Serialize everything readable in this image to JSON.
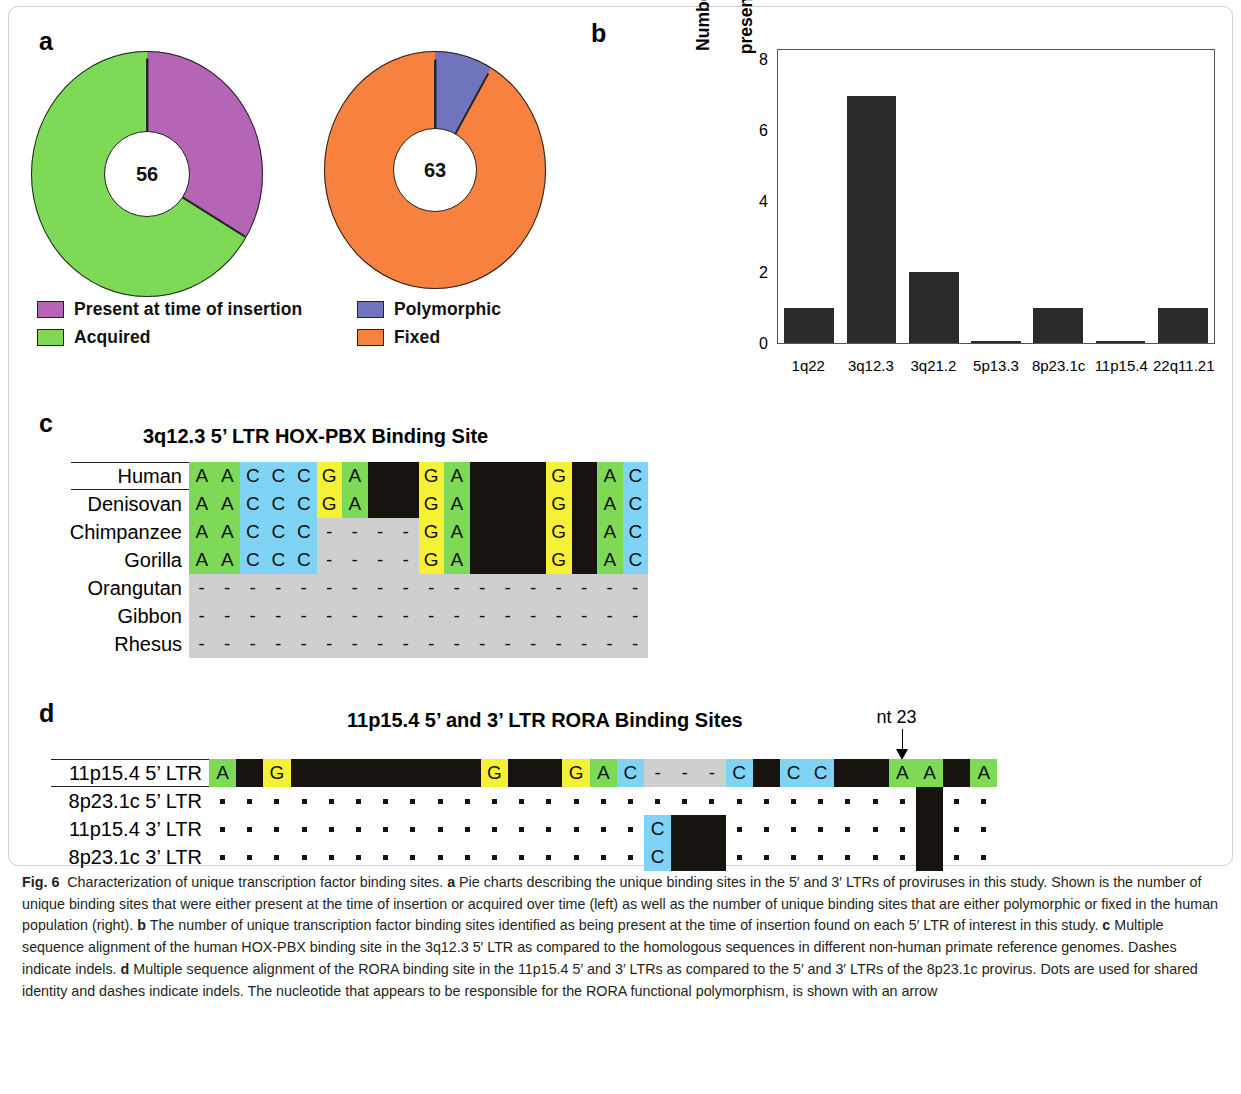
{
  "figure": {
    "label": "Fig. 6",
    "caption": "Characterization of unique transcription factor binding sites. <b>a</b> Pie charts describing the unique binding sites in the 5′ and 3′ LTRs of proviruses in this study. Shown is the number of unique binding sites that were either present at the time of insertion or acquired over time (left) as well as the number of unique binding sites that are either polymorphic or fixed in the human population (right). <b>b</b> The number of unique transcription factor binding sites identified as being present at the time of insertion found on each 5′ LTR of interest in this study. <b>c</b> Multiple sequence alignment of the human HOX-PBX binding site in the 3q12.3 5′ LTR as compared to the homologous sequences in different non-human primate reference genomes. Dashes indicate indels. <b>d</b> Multiple sequence alignment of the RORA binding site in the 11p15.4 5′ and 3′ LTRs as compared to the 5′ and 3′ LTRs of the 8p23.1c provirus. Dots are used for shared identity and dashes indicate indels. The nucleotide that appears to be responsible for the RORA functional polymorphism, is shown with an arrow"
  },
  "panels": {
    "a": {
      "letter": "a"
    },
    "b": {
      "letter": "b"
    },
    "c": {
      "letter": "c"
    },
    "d": {
      "letter": "d"
    }
  },
  "chart_data": [
    {
      "type": "pie",
      "id": "donut-left",
      "center_label": "56",
      "total": 56,
      "labels": [
        "Present at time of insertion",
        "Acquired"
      ],
      "values": [
        19,
        37
      ],
      "percents": [
        33.9,
        66.1
      ],
      "colors": [
        "#b565b5",
        "#7ed957"
      ],
      "legend_position": "below",
      "title": ""
    },
    {
      "type": "pie",
      "id": "donut-right",
      "center_label": "63",
      "total": 63,
      "labels": [
        "Polymorphic",
        "Fixed"
      ],
      "values": [
        5,
        58
      ],
      "percents": [
        7.9,
        92.1
      ],
      "colors": [
        "#6f74bc",
        "#f7813f"
      ],
      "legend_position": "below",
      "title": ""
    },
    {
      "type": "bar",
      "id": "panel-b-bars",
      "title": "",
      "xlabel": "",
      "ylabel": "Number of unique binding sites\npresent at time of insertion",
      "categories": [
        "1q22",
        "3q12.3",
        "3q21.2",
        "5p13.3",
        "8p23.1c",
        "11p15.4",
        "22q11.21"
      ],
      "values": [
        1,
        7,
        2,
        0,
        1,
        0,
        1
      ],
      "ylim": [
        0,
        8.3
      ],
      "yticks": [
        0,
        2,
        4,
        6,
        8
      ],
      "ytick_labels": [
        "0",
        "2",
        "4",
        "6",
        "8"
      ],
      "grid": false,
      "bar_color": "#2b2b2b"
    }
  ],
  "alignment_c": {
    "title": "3q12.3 5’ LTR HOX-PBX Binding Site",
    "columns": 16,
    "rows": [
      {
        "label": "Human",
        "cells": [
          "A",
          "A",
          "C",
          "C",
          "C",
          "G",
          "A",
          "#",
          "#",
          "G",
          "A",
          "#",
          "#",
          "#",
          "G",
          "#",
          "A",
          "C"
        ]
      },
      {
        "label": "Denisovan",
        "cells": [
          "A",
          "A",
          "C",
          "C",
          "C",
          "G",
          "A",
          "#",
          "#",
          "G",
          "A",
          "#",
          "#",
          "#",
          "G",
          "#",
          "A",
          "C"
        ]
      },
      {
        "label": "Chimpanzee",
        "cells": [
          "A",
          "A",
          "C",
          "C",
          "C",
          "-",
          "-",
          "-",
          "-",
          "G",
          "A",
          "#",
          "#",
          "#",
          "G",
          "#",
          "A",
          "C"
        ]
      },
      {
        "label": "Gorilla",
        "cells": [
          "A",
          "A",
          "C",
          "C",
          "C",
          "-",
          "-",
          "-",
          "-",
          "G",
          "A",
          "#",
          "#",
          "#",
          "G",
          "#",
          "A",
          "C"
        ]
      },
      {
        "label": "Orangutan",
        "cells": [
          "-",
          "-",
          "-",
          "-",
          "-",
          "-",
          "-",
          "-",
          "-",
          "-",
          "-",
          "-",
          "-",
          "-",
          "-",
          "-",
          "-",
          "-"
        ]
      },
      {
        "label": "Gibbon",
        "cells": [
          "-",
          "-",
          "-",
          "-",
          "-",
          "-",
          "-",
          "-",
          "-",
          "-",
          "-",
          "-",
          "-",
          "-",
          "-",
          "-",
          "-",
          "-"
        ]
      },
      {
        "label": "Rhesus",
        "cells": [
          "-",
          "-",
          "-",
          "-",
          "-",
          "-",
          "-",
          "-",
          "-",
          "-",
          "-",
          "-",
          "-",
          "-",
          "-",
          "-",
          "-",
          "-"
        ]
      }
    ]
  },
  "alignment_d": {
    "title": "11p15.4 5’ and 3’ LTR RORA Binding Sites",
    "annotation": {
      "text": "nt 23",
      "column_index": 25
    },
    "columns": 29,
    "rows": [
      {
        "label": "11p15.4 5’ LTR",
        "cells": [
          "A",
          "#",
          "G",
          "#",
          "#",
          "#",
          "#",
          "#",
          "#",
          "#",
          "G",
          "#",
          "#",
          "G",
          "A",
          "C",
          "-",
          "-",
          "-",
          "C",
          "#",
          "C",
          "C",
          "#",
          "#",
          "A",
          "A",
          "#",
          "A"
        ]
      },
      {
        "label": "8p23.1c 5’ LTR",
        "cells": [
          ".",
          ".",
          ".",
          ".",
          ".",
          ".",
          ".",
          ".",
          ".",
          ".",
          ".",
          ".",
          ".",
          ".",
          ".",
          ".",
          ".",
          ".",
          ".",
          ".",
          ".",
          ".",
          ".",
          ".",
          ".",
          ".",
          "#",
          ".",
          "."
        ]
      },
      {
        "label": "11p15.4 3’ LTR",
        "cells": [
          ".",
          ".",
          ".",
          ".",
          ".",
          ".",
          ".",
          ".",
          ".",
          ".",
          ".",
          ".",
          ".",
          ".",
          ".",
          ".",
          "C",
          "#",
          "#",
          ".",
          ".",
          ".",
          ".",
          ".",
          ".",
          ".",
          "#",
          ".",
          "."
        ]
      },
      {
        "label": "8p23.1c 3’ LTR",
        "cells": [
          ".",
          ".",
          ".",
          ".",
          ".",
          ".",
          ".",
          ".",
          ".",
          ".",
          ".",
          ".",
          ".",
          ".",
          ".",
          ".",
          "C",
          "#",
          "#",
          ".",
          ".",
          ".",
          ".",
          ".",
          ".",
          ".",
          "#",
          ".",
          "."
        ]
      }
    ]
  },
  "colors": {
    "A": "#7ed957",
    "C": "#7fd4f5",
    "G": "#f7f136",
    "black": "#171410",
    "gap_gray": "#cfcfcf",
    "purple": "#b565b5",
    "green": "#7ed957",
    "blue_violet": "#6f74bc",
    "orange": "#f7813f",
    "bar": "#2b2b2b"
  }
}
